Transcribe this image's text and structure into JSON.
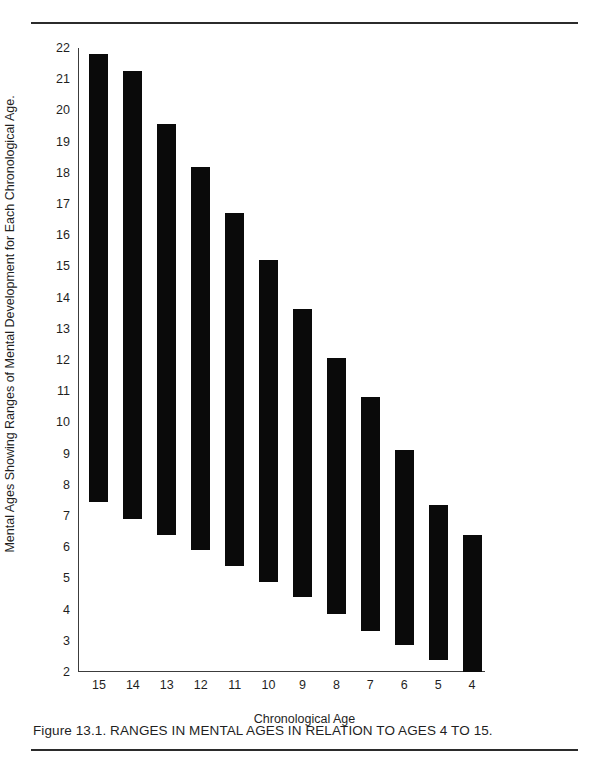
{
  "figure": {
    "caption": "Figure 13.1. RANGES IN MENTAL AGES IN RELATION TO AGES 4 TO 15.",
    "xlabel": "Chronological Age",
    "ylabel": "Mental Ages Showing Ranges of Mental Development for Each Chronological Age.",
    "bar_color": "#0a0a0a",
    "axis_color": "#3c3c3c",
    "rule_color": "#2b2b2b"
  },
  "chart_data": {
    "type": "bar",
    "orientation": "vertical",
    "style": "floating range bars (min-max)",
    "title": "",
    "xlabel": "Chronological Age",
    "ylabel": "Mental Ages Showing Ranges of Mental Development for Each Chronological Age.",
    "categories": [
      "15",
      "14",
      "13",
      "12",
      "11",
      "10",
      "9",
      "8",
      "7",
      "6",
      "5",
      "4"
    ],
    "xtick_labels": [
      "15",
      "14",
      "13",
      "12",
      "11",
      "10",
      "9",
      "8",
      "7",
      "6",
      "5",
      "4"
    ],
    "ytick_labels": [
      "22",
      "21",
      "20",
      "19",
      "18",
      "17",
      "16",
      "15",
      "14",
      "13",
      "12",
      "11",
      "10",
      "9",
      "8",
      "7",
      "6",
      "5",
      "4",
      "3",
      "2"
    ],
    "yticks": [
      22,
      21,
      20,
      19,
      18,
      17,
      16,
      15,
      14,
      13,
      12,
      11,
      10,
      9,
      8,
      7,
      6,
      5,
      4,
      3,
      2
    ],
    "ylim": [
      2,
      22
    ],
    "grid": false,
    "legend": null,
    "series": [
      {
        "name": "Range of mental ages",
        "low": [
          7.45,
          6.9,
          6.4,
          5.9,
          5.4,
          4.9,
          4.4,
          3.85,
          3.3,
          2.85,
          2.4,
          2.0
        ],
        "high": [
          21.8,
          21.25,
          19.55,
          18.2,
          16.7,
          15.2,
          13.65,
          12.05,
          10.8,
          9.1,
          7.35,
          6.4
        ]
      }
    ],
    "bars": [
      {
        "category": "15",
        "low": 7.45,
        "high": 21.8
      },
      {
        "category": "14",
        "low": 6.9,
        "high": 21.25
      },
      {
        "category": "13",
        "low": 6.4,
        "high": 19.55
      },
      {
        "category": "12",
        "low": 5.9,
        "high": 18.2
      },
      {
        "category": "11",
        "low": 5.4,
        "high": 16.7
      },
      {
        "category": "10",
        "low": 4.9,
        "high": 15.2
      },
      {
        "category": "9",
        "low": 4.4,
        "high": 13.65
      },
      {
        "category": "8",
        "low": 3.85,
        "high": 12.05
      },
      {
        "category": "7",
        "low": 3.3,
        "high": 10.8
      },
      {
        "category": "6",
        "low": 2.85,
        "high": 9.1
      },
      {
        "category": "5",
        "low": 2.4,
        "high": 7.35
      },
      {
        "category": "4",
        "low": 2.0,
        "high": 6.4
      }
    ]
  }
}
